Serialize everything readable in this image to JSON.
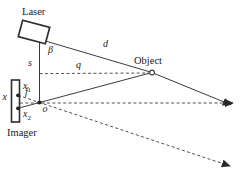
{
  "figure": {
    "labels": {
      "laser": "Laser",
      "object": "Object",
      "imager": "Imager",
      "beta": "β",
      "d": "d",
      "s": "s",
      "q": "q",
      "f": "f",
      "o": "o",
      "x_axis": "x",
      "x1_base": "x",
      "x1_sub": "1",
      "x2_base": "x",
      "x2_sub": "2"
    },
    "colors": {
      "background": "#ffffff",
      "line": "#3c3c3c",
      "text": "#1a1a1a"
    }
  }
}
